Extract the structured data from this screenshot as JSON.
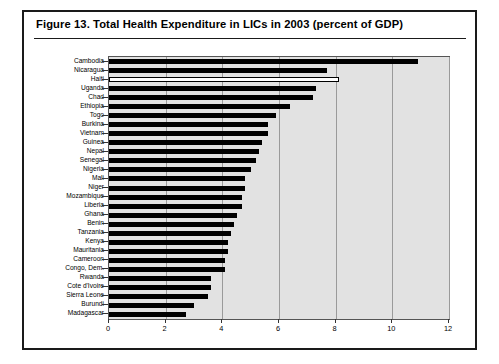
{
  "figure": {
    "title": "Figure 13.  Total Health Expenditure in LICs in 2003 (percent of GDP)"
  },
  "style": {
    "plot_background": "#e2e2e2",
    "bar_color": "#000000",
    "highlight_bar_color": "#ffffff",
    "frame_color": "#1a1a1a",
    "gridline_color": "#9a9a9a"
  },
  "chart_data": {
    "type": "bar",
    "orientation": "horizontal",
    "title": "Figure 13.  Total Health Expenditure in LICs in 2003 (percent of GDP)",
    "xlabel": "",
    "ylabel": "",
    "xlim": [
      0,
      12
    ],
    "xticks": [
      0,
      2,
      4,
      6,
      8,
      10,
      12
    ],
    "xtick_labels": [
      "0",
      "2",
      "4",
      "6",
      "8",
      "10",
      "12"
    ],
    "grid": true,
    "grid_axis": "x",
    "legend": null,
    "highlight_category": "Haiti",
    "highlight_note": "Haiti bar is drawn hollow (white fill, black outline); all other bars are solid black.",
    "categories": [
      "Cambodia",
      "Nicaragua",
      "Haiti",
      "Uganda",
      "Chad",
      "Ethiopia",
      "Togo",
      "Burkina",
      "Vietnam",
      "Guinea",
      "Nepal",
      "Senegal",
      "Nigeria",
      "Mali",
      "Niger",
      "Mozambique",
      "Liberia",
      "Ghana",
      "Benin",
      "Tanzania",
      "Kenya",
      "Mauritania",
      "Cameroon",
      "Congo, Dem.",
      "Rwanda",
      "Cote d'Ivoire",
      "Sierra Leone",
      "Burundi",
      "Madagascar"
    ],
    "values": [
      10.9,
      7.7,
      8.1,
      7.3,
      7.2,
      6.4,
      5.9,
      5.6,
      5.6,
      5.4,
      5.3,
      5.2,
      5.0,
      4.8,
      4.8,
      4.7,
      4.7,
      4.5,
      4.4,
      4.3,
      4.2,
      4.2,
      4.1,
      4.1,
      3.6,
      3.6,
      3.5,
      3.0,
      2.7
    ],
    "value_unit": "percent of GDP"
  }
}
